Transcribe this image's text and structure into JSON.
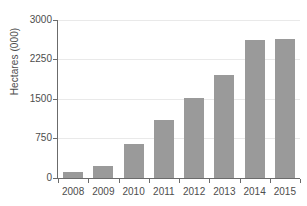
{
  "chart_data": {
    "type": "bar",
    "title": "",
    "subtitle": "",
    "xlabel": "",
    "ylabel": "Hectares (000)",
    "categories": [
      "2008",
      "2009",
      "2010",
      "2011",
      "2012",
      "2013",
      "2014",
      "2015"
    ],
    "values": [
      110,
      225,
      650,
      1100,
      1520,
      1950,
      2620,
      2640
    ],
    "series": [
      {
        "name": "Hectares",
        "values": [
          110,
          225,
          650,
          1100,
          1520,
          1950,
          2620,
          2640
        ]
      }
    ],
    "ylim": [
      0,
      3000
    ],
    "yticks": [
      0,
      750,
      1500,
      2250,
      3000
    ],
    "ytick_labels": [
      "0",
      "750",
      "1500",
      "2250",
      "3000"
    ],
    "grid": true,
    "legend": false,
    "legend_position": "none",
    "bar_color": "#9a9a9a",
    "axis_color": "#6b6b6b",
    "grid_color": "#e9e9e9",
    "text_color": "#4d4d4d",
    "background": "#ffffff"
  }
}
